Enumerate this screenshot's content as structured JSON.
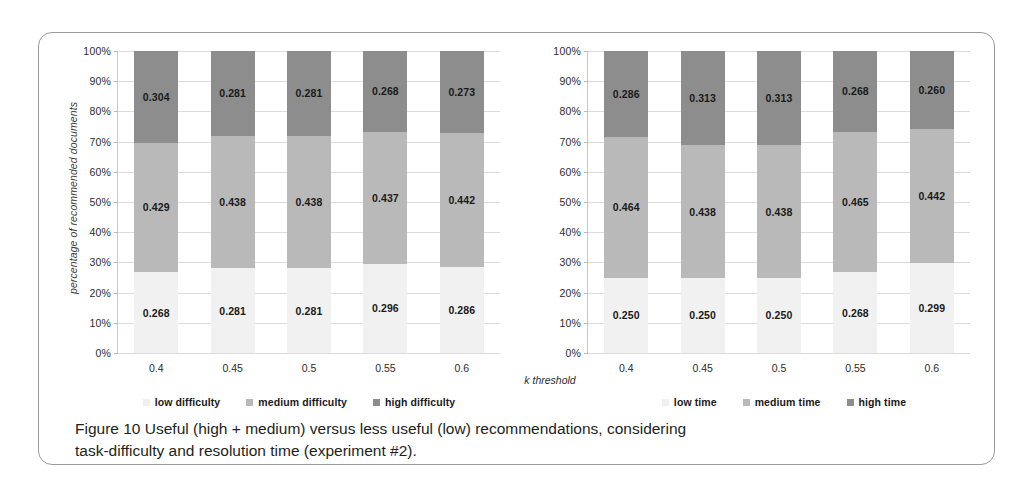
{
  "figure": {
    "caption_line1": "Figure 10 Useful (high + medium) versus less useful (low) recommendations, considering",
    "caption_line2": "task-difficulty and resolution time (experiment #2)."
  },
  "axis": {
    "y_title": "percentage of recommended documents",
    "x_title": "k threshold",
    "y_ticks": [
      "0%",
      "10%",
      "20%",
      "30%",
      "40%",
      "50%",
      "60%",
      "70%",
      "80%",
      "90%",
      "100%"
    ]
  },
  "colors": {
    "low": "#f1f1f1",
    "medium": "#b9b9b9",
    "high": "#8d8d8d",
    "gridline": "#dcdcdc",
    "axis": "#c9c9c9",
    "frame": "#9a9a9a",
    "text": "#231f20"
  },
  "chart_data": [
    {
      "type": "bar",
      "id": "difficulty",
      "stacked": true,
      "stacked_normalized": true,
      "title": "",
      "xlabel": "k threshold",
      "ylabel": "percentage of recommended documents",
      "ylim": [
        0,
        1
      ],
      "ytick_labels": [
        "0%",
        "10%",
        "20%",
        "30%",
        "40%",
        "50%",
        "60%",
        "70%",
        "80%",
        "90%",
        "100%"
      ],
      "grid": true,
      "legend_position": "bottom",
      "categories": [
        "0.4",
        "0.45",
        "0.5",
        "0.55",
        "0.6"
      ],
      "series": [
        {
          "name": "low difficulty",
          "values": [
            0.268,
            0.281,
            0.281,
            0.296,
            0.286
          ]
        },
        {
          "name": "medium difficulty",
          "values": [
            0.429,
            0.438,
            0.438,
            0.437,
            0.442
          ]
        },
        {
          "name": "high difficulty",
          "values": [
            0.304,
            0.281,
            0.281,
            0.268,
            0.273
          ]
        }
      ]
    },
    {
      "type": "bar",
      "id": "time",
      "stacked": true,
      "stacked_normalized": true,
      "title": "",
      "xlabel": "k threshold",
      "ylabel": "percentage of recommended documents",
      "ylim": [
        0,
        1
      ],
      "ytick_labels": [
        "0%",
        "10%",
        "20%",
        "30%",
        "40%",
        "50%",
        "60%",
        "70%",
        "80%",
        "90%",
        "100%"
      ],
      "grid": true,
      "legend_position": "bottom",
      "categories": [
        "0.4",
        "0.45",
        "0.5",
        "0.55",
        "0.6"
      ],
      "series": [
        {
          "name": "low time",
          "values": [
            0.25,
            0.25,
            0.25,
            0.268,
            0.299
          ]
        },
        {
          "name": "medium time",
          "values": [
            0.464,
            0.438,
            0.438,
            0.465,
            0.442
          ]
        },
        {
          "name": "high time",
          "values": [
            0.286,
            0.313,
            0.313,
            0.268,
            0.26
          ]
        }
      ]
    }
  ]
}
